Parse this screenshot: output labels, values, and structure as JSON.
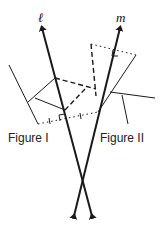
{
  "diagram": {
    "type": "reflection-across-intersecting-lines",
    "lines": [
      {
        "name": "l",
        "label": "ℓ"
      },
      {
        "name": "m",
        "label": "m"
      }
    ],
    "figures": [
      {
        "name": "figure-1",
        "label": "Figure I"
      },
      {
        "name": "figure-2",
        "label": "Figure II"
      }
    ],
    "colors": {
      "stroke": "#1a1a1a",
      "background": "#ffffff"
    }
  }
}
